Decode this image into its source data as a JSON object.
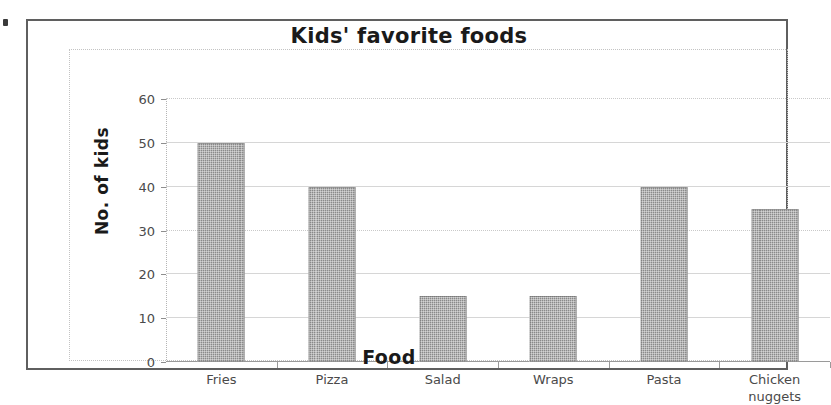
{
  "chart_data": {
    "type": "bar",
    "title": "Kids' favorite foods",
    "xlabel": "Food",
    "ylabel": "No. of kids",
    "categories": [
      "Fries",
      "Pizza",
      "Salad",
      "Wraps",
      "Pasta",
      "Chicken nuggets"
    ],
    "category_lines": [
      [
        "Fries"
      ],
      [
        "Pizza"
      ],
      [
        "Salad"
      ],
      [
        "Wraps"
      ],
      [
        "Pasta"
      ],
      [
        "Chicken",
        "nuggets"
      ]
    ],
    "values": [
      50,
      40,
      15,
      15,
      40,
      35
    ],
    "ylim": [
      0,
      60
    ],
    "yticks": [
      0,
      10,
      20,
      30,
      40,
      50,
      60
    ],
    "ytick_labels": [
      "0",
      "10",
      "20",
      "30",
      "40",
      "50",
      "60"
    ],
    "grid": true,
    "legend": false,
    "bar_color": "#8a8a8a",
    "frame_color": "#5f5f5f",
    "gridline_color": "#d6d6d6",
    "text_color": "#1a1a1a",
    "tick_text_color": "#4a4a4a"
  }
}
